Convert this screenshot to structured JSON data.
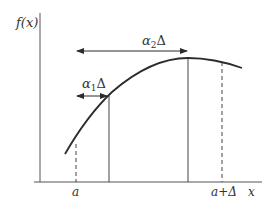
{
  "diagram": {
    "y_axis_label": "f(x)",
    "x_axis_label": "x",
    "tick_a": "a",
    "tick_a_plus_delta": "a+Δ",
    "arrow_alpha2": {
      "symbol": "α",
      "sub": "2",
      "suffix": "Δ"
    },
    "arrow_alpha1": {
      "symbol": "α",
      "sub": "1",
      "suffix": "Δ"
    },
    "colors": {
      "line": "#2b2b2b",
      "axis": "#555555",
      "text": "#333333"
    }
  }
}
